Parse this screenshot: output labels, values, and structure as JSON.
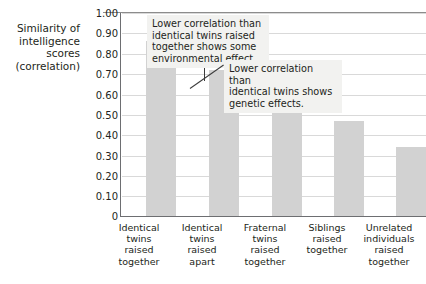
{
  "chart_data": {
    "type": "bar",
    "title": "",
    "xlabel": "",
    "ylabel": "Similarity of intelligence scores (correlation)",
    "ylabel_lines": [
      "Similarity of",
      "intelligence",
      "scores",
      "(correlation)"
    ],
    "categories": [
      "Identical twins raised together",
      "Identical twins raised apart",
      "Fraternal twins raised together",
      "Siblings raised together",
      "Unrelated individuals raised together"
    ],
    "category_lines": [
      [
        "Identical",
        "twins",
        "raised",
        "together"
      ],
      [
        "Identical",
        "twins",
        "raised",
        "apart"
      ],
      [
        "Fraternal",
        "twins",
        "raised",
        "together"
      ],
      [
        "Siblings",
        "raised",
        "together"
      ],
      [
        "Unrelated",
        "individuals",
        "raised",
        "together"
      ]
    ],
    "values": [
      0.86,
      0.72,
      0.6,
      0.47,
      0.34
    ],
    "ylim": [
      0,
      1.0
    ],
    "ytick_values": [
      1.0,
      0.9,
      0.8,
      0.7,
      0.6,
      0.5,
      0.4,
      0.3,
      0.2,
      0.1,
      0
    ],
    "ytick_labels": [
      "1.00",
      "0.90",
      "0.80",
      "0.70",
      "0.60",
      "0.50",
      "0.40",
      "0.30",
      "0.20",
      "0.10",
      "0"
    ],
    "grid": true,
    "legend": false,
    "bar_color": "#d2d2d2",
    "axis_color": "#6d6e71",
    "grid_color": "#d9d9d9",
    "text_color": "#231f20",
    "annotations": [
      {
        "id": "environmental",
        "text": "Lower correlation than identical twins raised together shows some environmental effect.",
        "lines": [
          "Lower correlation than",
          "identical twins raised",
          "together shows some",
          "environmental effect."
        ],
        "points_to": "Identical twins raised apart"
      },
      {
        "id": "genetic",
        "text": "Lower correlation than identical twins shows genetic effects.",
        "lines": [
          "Lower correlation than",
          "identical twins shows",
          "genetic effects."
        ],
        "points_to": "Fraternal twins raised together"
      }
    ]
  }
}
